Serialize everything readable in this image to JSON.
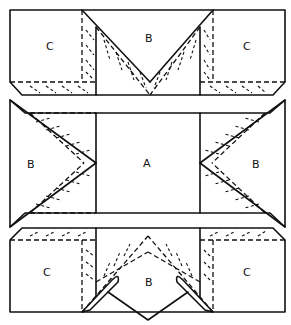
{
  "diagram": {
    "type": "quilt-block-assembly",
    "rows": [
      {
        "name": "top-row",
        "pieces": [
          {
            "id": "c-top-left",
            "label": "C"
          },
          {
            "id": "b-top",
            "label": "B"
          },
          {
            "id": "c-top-right",
            "label": "C"
          }
        ]
      },
      {
        "name": "middle-row",
        "pieces": [
          {
            "id": "b-middle-left",
            "label": "B"
          },
          {
            "id": "a-center",
            "label": "A"
          },
          {
            "id": "b-middle-right",
            "label": "B"
          }
        ]
      },
      {
        "name": "bottom-row",
        "pieces": [
          {
            "id": "c-bottom-left",
            "label": "C"
          },
          {
            "id": "b-bottom",
            "label": "B"
          },
          {
            "id": "c-bottom-right",
            "label": "C"
          }
        ]
      }
    ],
    "annotations": {
      "pointer_lines": "two leader lines meeting at a point below bottom B, pointing to the folded seam allowances",
      "stitching": "dashed lines with small arrows indicate quilting/stitch direction along V-shaped strips"
    },
    "colors": {
      "line": "#111111",
      "background": "#ffffff"
    }
  }
}
